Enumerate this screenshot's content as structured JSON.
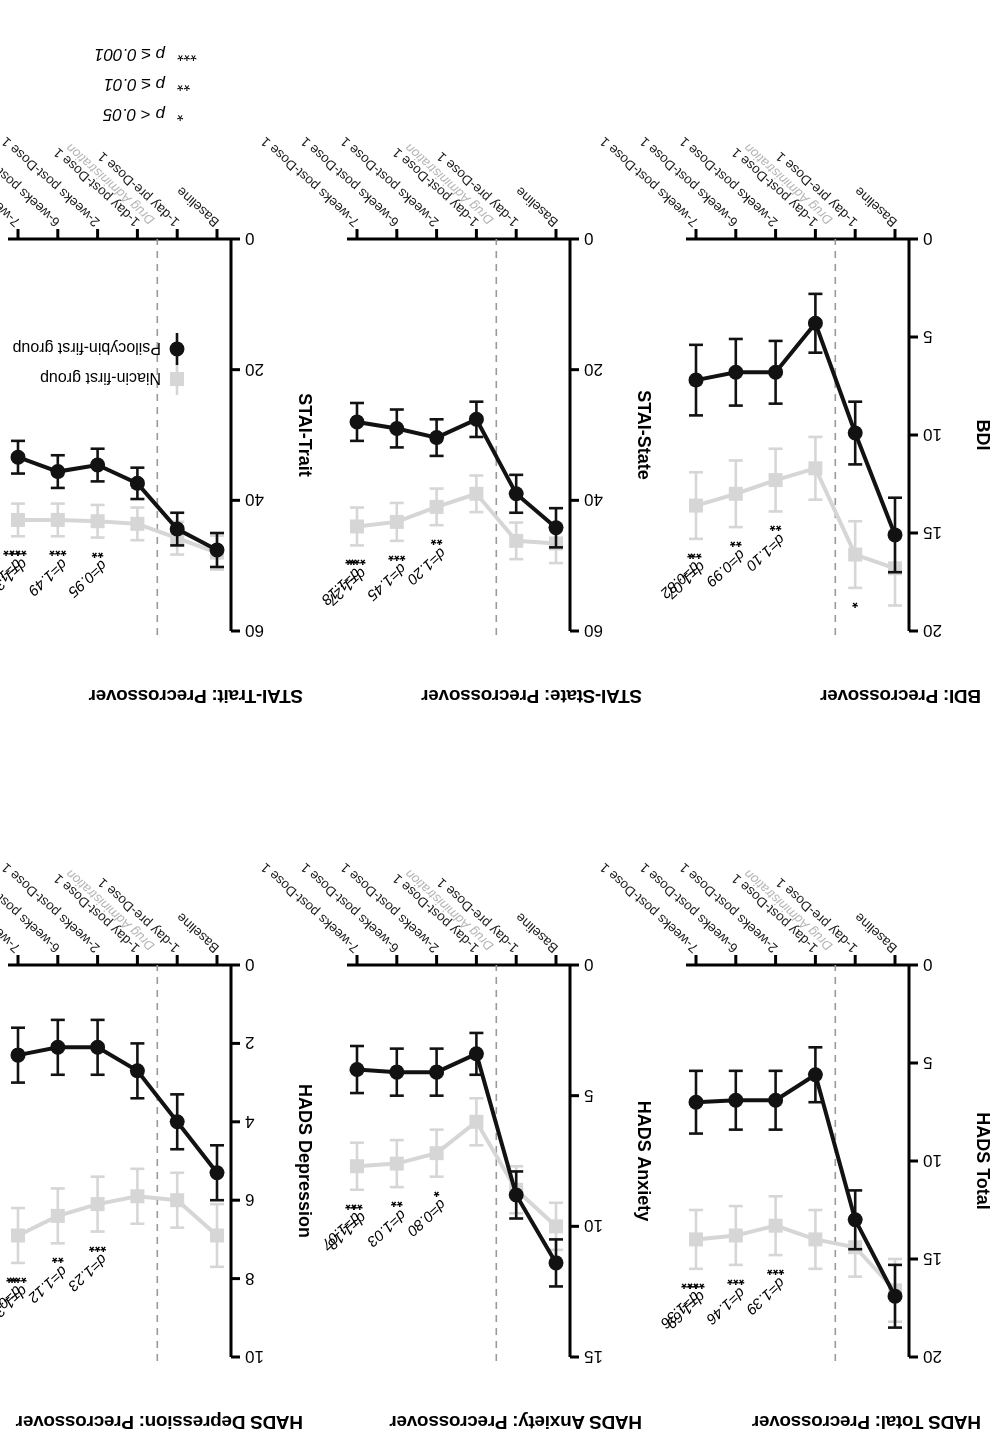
{
  "figure": {
    "x_categories": [
      "Baseline",
      "1-day pre-Dose 1",
      "1-day post-Dose 1",
      "2-weeks post-Dose 1",
      "6-weeks post-Dose 1",
      "7-weeks post-Dose 1"
    ],
    "drug_admin_note": "Drug Administration",
    "legend": {
      "niacin_label": "Niacin-first group",
      "psilocybin_label": "Psilocybin-first group",
      "niacin_color": "#d6d6d6",
      "psilocybin_color": "#121212"
    },
    "significance_legend": [
      {
        "stars": "*",
        "text": "p < 0.05"
      },
      {
        "stars": "**",
        "text": "p ≤ 0.01"
      },
      {
        "stars": "***",
        "text": "p ≤ 0.001"
      }
    ]
  },
  "chart_data": [
    {
      "type": "line",
      "title": "HADS Total: Precrossover",
      "ylabel": "HADS Total",
      "xlabel": "",
      "ylim": [
        0,
        20
      ],
      "yticks": [
        0,
        5,
        10,
        15,
        20
      ],
      "grid": false,
      "categories": [
        "Baseline",
        "1-day pre-Dose 1",
        "1-day post-Dose 1",
        "2-weeks post-Dose 1",
        "6-weeks post-Dose 1",
        "7-weeks post-Dose 1"
      ],
      "series": [
        {
          "name": "Niacin-first group",
          "values": [
            16.6,
            14.4,
            14.0,
            13.3,
            13.8,
            14.0
          ],
          "errors": [
            1.6,
            1.5,
            1.5,
            1.5,
            1.5,
            1.5
          ]
        },
        {
          "name": "Psilocybin-first group",
          "values": [
            16.9,
            13.0,
            5.6,
            6.9,
            6.9,
            7.0
          ],
          "errors": [
            1.6,
            1.5,
            1.4,
            1.5,
            1.5,
            1.6
          ]
        }
      ],
      "annotations": [
        {
          "at": "2-weeks post-Dose 1",
          "d": "d=1.39",
          "stars": "***"
        },
        {
          "at": "6-weeks post-Dose 1",
          "d": "d=1.46",
          "stars": "***"
        },
        {
          "at": "7-weeks post-Dose 1",
          "d": "d=1.69",
          "stars": "***"
        },
        {
          "at": "7-weeks post-Dose 1b",
          "d": "d=1.36",
          "stars": "***"
        }
      ]
    },
    {
      "type": "line",
      "title": "HADS Anxiety: Precrossover",
      "ylabel": "HADS Anxiety",
      "xlabel": "",
      "ylim": [
        0,
        15
      ],
      "yticks": [
        0,
        5,
        10,
        15
      ],
      "grid": false,
      "categories": [
        "Baseline",
        "1-day pre-Dose 1",
        "1-day post-Dose 1",
        "2-weeks post-Dose 1",
        "6-weeks post-Dose 1",
        "7-weeks post-Dose 1"
      ],
      "series": [
        {
          "name": "Niacin-first group",
          "values": [
            10.0,
            8.6,
            6.0,
            7.2,
            7.6,
            7.7
          ],
          "errors": [
            0.9,
            0.9,
            0.9,
            0.9,
            0.9,
            0.9
          ]
        },
        {
          "name": "Psilocybin-first group",
          "values": [
            11.4,
            8.8,
            3.4,
            4.1,
            4.1,
            4.0
          ],
          "errors": [
            0.9,
            0.9,
            0.8,
            0.9,
            0.9,
            0.9
          ]
        }
      ],
      "annotations": [
        {
          "at": "2-weeks post-Dose 1",
          "d": "d=0.80",
          "stars": "*"
        },
        {
          "at": "6-weeks post-Dose 1",
          "d": "d=1.03",
          "stars": "**"
        },
        {
          "at": "7-weeks post-Dose 1",
          "d": "d=1.18",
          "stars": "**"
        },
        {
          "at": "7-weeks post-Dose 1b",
          "d": "d=1.07",
          "stars": "**"
        }
      ]
    },
    {
      "type": "line",
      "title": "HADS Depression: Precrossover",
      "ylabel": "HADS Depression",
      "xlabel": "",
      "ylim": [
        0,
        10
      ],
      "yticks": [
        0,
        2,
        4,
        6,
        8,
        10
      ],
      "grid": false,
      "categories": [
        "Baseline",
        "1-day pre-Dose 1",
        "1-day post-Dose 1",
        "2-weeks post-Dose 1",
        "6-weeks post-Dose 1",
        "7-weeks post-Dose 1"
      ],
      "series": [
        {
          "name": "Niacin-first group",
          "values": [
            6.9,
            6.0,
            5.9,
            6.1,
            6.4,
            6.9
          ],
          "errors": [
            0.8,
            0.7,
            0.7,
            0.7,
            0.7,
            0.7
          ]
        },
        {
          "name": "Psilocybin-first group",
          "values": [
            5.3,
            4.0,
            2.7,
            2.1,
            2.1,
            2.3
          ],
          "errors": [
            0.7,
            0.7,
            0.7,
            0.7,
            0.7,
            0.7
          ]
        }
      ],
      "annotations": [
        {
          "at": "2-weeks post-Dose 1",
          "d": "d=1.23",
          "stars": "***"
        },
        {
          "at": "6-weeks post-Dose 1",
          "d": "d=1.12",
          "stars": "**"
        },
        {
          "at": "7-weeks post-Dose 1",
          "d": "d=1.32",
          "stars": "***"
        },
        {
          "at": "7-weeks post-Dose 1b",
          "d": "d=0.98",
          "stars": "**"
        }
      ]
    },
    {
      "type": "line",
      "title": "BDI: Precrossover",
      "ylabel": "BDI",
      "xlabel": "",
      "ylim": [
        0,
        20
      ],
      "yticks": [
        0,
        5,
        10,
        15,
        20
      ],
      "grid": false,
      "categories": [
        "Baseline",
        "1-day pre-Dose 1",
        "1-day post-Dose 1",
        "2-weeks post-Dose 1",
        "6-weeks post-Dose 1",
        "7-weeks post-Dose 1"
      ],
      "series": [
        {
          "name": "Niacin-first group",
          "values": [
            16.8,
            16.1,
            11.7,
            12.3,
            13.0,
            13.6
          ],
          "errors": [
            1.9,
            1.7,
            1.6,
            1.6,
            1.7,
            1.7
          ]
        },
        {
          "name": "Psilocybin-first group",
          "values": [
            15.1,
            9.9,
            4.3,
            6.8,
            6.8,
            7.2
          ],
          "errors": [
            1.9,
            1.6,
            1.5,
            1.6,
            1.7,
            1.8
          ]
        }
      ],
      "annotations": [
        {
          "at": "1-day pre-Dose 1",
          "d": "",
          "stars": "*"
        },
        {
          "at": "2-weeks post-Dose 1",
          "d": "d=1.10",
          "stars": "**"
        },
        {
          "at": "6-weeks post-Dose 1",
          "d": "d=0.99",
          "stars": "**"
        },
        {
          "at": "7-weeks post-Dose 1",
          "d": "d=1.07",
          "stars": "**"
        },
        {
          "at": "7-weeks post-Dose 1b",
          "d": "d=0.82",
          "stars": "*"
        }
      ]
    },
    {
      "type": "line",
      "title": "STAI-State: Precrossover",
      "ylabel": "STAI-State",
      "xlabel": "",
      "ylim": [
        0,
        60
      ],
      "yticks": [
        0,
        20,
        40,
        60
      ],
      "grid": false,
      "categories": [
        "Baseline",
        "1-day pre-Dose 1",
        "1-day post-Dose 1",
        "2-weeks post-Dose 1",
        "6-weeks post-Dose 1",
        "7-weeks post-Dose 1"
      ],
      "series": [
        {
          "name": "Niacin-first group",
          "values": [
            46.6,
            46.2,
            39.0,
            41.0,
            43.3,
            44.0
          ],
          "errors": [
            3.0,
            2.8,
            2.8,
            2.8,
            2.9,
            2.9
          ]
        },
        {
          "name": "Psilocybin-first group",
          "values": [
            44.2,
            39.0,
            27.6,
            30.4,
            29.0,
            28.0
          ],
          "errors": [
            3.0,
            2.9,
            2.7,
            2.8,
            2.9,
            2.9
          ]
        }
      ],
      "annotations": [
        {
          "at": "2-weeks post-Dose 1",
          "d": "d=1.20",
          "stars": "**"
        },
        {
          "at": "6-weeks post-Dose 1",
          "d": "d=1.45",
          "stars": "***"
        },
        {
          "at": "7-weeks post-Dose 1",
          "d": "d=1.27",
          "stars": "***"
        },
        {
          "at": "7-weeks post-Dose 1b",
          "d": "d=1.18",
          "stars": "**"
        }
      ]
    },
    {
      "type": "line",
      "title": "STAI-Trait: Precrossover",
      "ylabel": "STAI-Trait",
      "xlabel": "",
      "ylim": [
        0,
        60
      ],
      "yticks": [
        0,
        20,
        40,
        60
      ],
      "grid": false,
      "categories": [
        "Baseline",
        "1-day pre-Dose 1",
        "1-day post-Dose 1",
        "2-weeks post-Dose 1",
        "6-weeks post-Dose 1",
        "7-weeks post-Dose 1"
      ],
      "series": [
        {
          "name": "Niacin-first group",
          "values": [
            48.0,
            45.8,
            43.6,
            43.2,
            43.0,
            43.0
          ],
          "errors": [
            2.6,
            2.5,
            2.5,
            2.5,
            2.5,
            2.5
          ]
        },
        {
          "name": "Psilocybin-first group",
          "values": [
            47.6,
            44.4,
            37.4,
            34.6,
            35.6,
            33.4
          ],
          "errors": [
            2.6,
            2.5,
            2.4,
            2.5,
            2.5,
            2.5
          ]
        }
      ],
      "annotations": [
        {
          "at": "2-weeks post-Dose 1",
          "d": "d=0.95",
          "stars": "**"
        },
        {
          "at": "6-weeks post-Dose 1",
          "d": "d=1.49",
          "stars": "***"
        },
        {
          "at": "7-weeks post-Dose 1",
          "d": "d=1.31",
          "stars": "***"
        },
        {
          "at": "7-weeks post-Dose 1b",
          "d": "d=1.29",
          "stars": "***"
        }
      ]
    }
  ]
}
